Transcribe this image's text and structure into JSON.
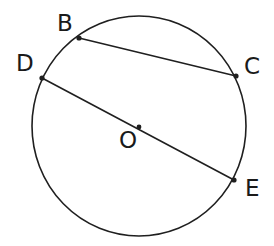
{
  "figure": {
    "kind": "circle-geometry-diagram",
    "width": 274,
    "height": 246,
    "background_color": "#ffffff",
    "stroke_color": "#1f1f1f",
    "label_color": "#1a1a1a",
    "stroke_width": 1.6,
    "circle": {
      "name": "main-circle",
      "center_label": "O",
      "center_x": 139,
      "center_y": 126,
      "radius_x": 107,
      "radius_y": 110
    },
    "center_dot": {
      "x": 139,
      "y": 127,
      "radius": 2.4
    },
    "points": [
      {
        "id": "B",
        "label": "B",
        "x": 79,
        "y": 38,
        "label_x": 57,
        "label_y": 12
      },
      {
        "id": "C",
        "label": "C",
        "x": 236,
        "y": 76,
        "label_x": 244,
        "label_y": 55
      },
      {
        "id": "D",
        "label": "D",
        "x": 42,
        "y": 78,
        "label_x": 16,
        "label_y": 52
      },
      {
        "id": "E",
        "label": "E",
        "x": 234,
        "y": 180,
        "label_x": 245,
        "label_y": 177
      }
    ],
    "center_label_pos": {
      "label": "O",
      "label_x": 119,
      "label_y": 129
    },
    "segments": [
      {
        "id": "BC",
        "name": "chord-bc",
        "from": "B",
        "to": "C",
        "x1": 79,
        "y1": 38,
        "x2": 236,
        "y2": 76,
        "kind": "chord"
      },
      {
        "id": "DE",
        "name": "diameter-de",
        "from": "D",
        "to": "E",
        "x1": 42,
        "y1": 78,
        "x2": 234,
        "y2": 180,
        "kind": "diameter"
      }
    ]
  }
}
